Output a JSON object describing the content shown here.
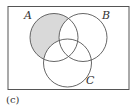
{
  "diagram": {
    "type": "venn",
    "sets": [
      {
        "label": "A",
        "shaded_region": "A only"
      },
      {
        "label": "B"
      },
      {
        "label": "C"
      }
    ],
    "shaded": "A − (B ∪ C)",
    "colors": {
      "shade": "#d9d9d9",
      "stroke": "#555555"
    },
    "caption": "(c)"
  }
}
